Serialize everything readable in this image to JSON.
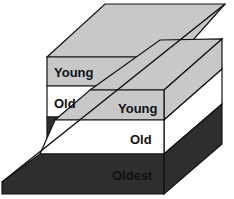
{
  "diagram": {
    "left_block": {
      "layers": [
        {
          "label": "Young"
        },
        {
          "label": "Old"
        }
      ]
    },
    "right_block": {
      "layers": [
        {
          "label": "Young"
        },
        {
          "label": "Old"
        },
        {
          "label": "Oldest"
        }
      ]
    },
    "colors": {
      "young": "#c8c8c8",
      "old": "#ffffff",
      "oldest": "#2e2e2e",
      "stroke": "#111111"
    }
  }
}
